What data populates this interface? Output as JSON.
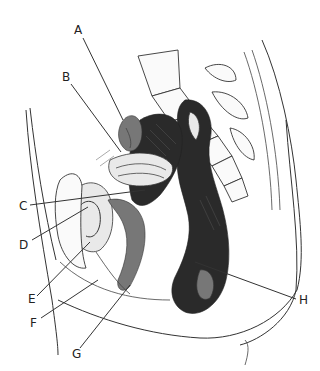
{
  "figure": {
    "type": "anatomical line drawing",
    "labels": [
      {
        "id": "A",
        "text": "A"
      },
      {
        "id": "B",
        "text": "B"
      },
      {
        "id": "C",
        "text": "C"
      },
      {
        "id": "D",
        "text": "D"
      },
      {
        "id": "E",
        "text": "E"
      },
      {
        "id": "F",
        "text": "F"
      },
      {
        "id": "G",
        "text": "G"
      },
      {
        "id": "H",
        "text": "H"
      }
    ]
  }
}
